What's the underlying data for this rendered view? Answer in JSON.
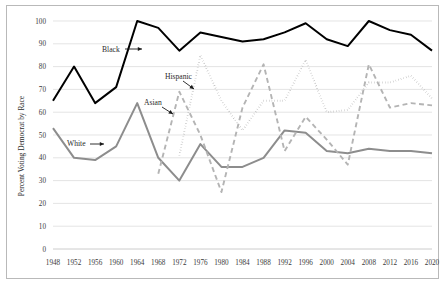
{
  "chart_data": {
    "type": "line",
    "title": "",
    "subtitle": "",
    "xlabel": "",
    "ylabel": "Percent Voting Democrat by Race",
    "xlim": [
      1948,
      2020
    ],
    "ylim": [
      0,
      100
    ],
    "ytick_step": 10,
    "yticks": [
      0,
      10,
      20,
      30,
      40,
      50,
      60,
      70,
      80,
      90,
      100
    ],
    "grid": true,
    "legend_position": "inline-annotations",
    "categories": [
      1948,
      1952,
      1956,
      1960,
      1964,
      1968,
      1972,
      1976,
      1980,
      1984,
      1988,
      1992,
      1996,
      2000,
      2004,
      2008,
      2012,
      2016,
      2020
    ],
    "xtick_labels": [
      "1948",
      "1952",
      "1956",
      "1960",
      "1964",
      "1968",
      "1972",
      "1976",
      "1980",
      "1984",
      "1988",
      "1992",
      "1996",
      "2000",
      "2004",
      "2008",
      "2012",
      "2016",
      "2020"
    ],
    "series": [
      {
        "name": "Black",
        "color": "#000000",
        "style": "solid",
        "width": 2.0,
        "x": [
          1948,
          1952,
          1956,
          1960,
          1964,
          1968,
          1972,
          1976,
          1980,
          1984,
          1988,
          1992,
          1996,
          2000,
          2004,
          2008,
          2012,
          2016,
          2020
        ],
        "values": [
          65,
          80,
          64,
          71,
          100,
          97,
          87,
          95,
          93,
          91,
          92,
          95,
          99,
          92,
          89,
          100,
          96,
          94,
          87
        ]
      },
      {
        "name": "White",
        "color": "#8d8d8d",
        "style": "solid",
        "width": 2.0,
        "x": [
          1948,
          1952,
          1956,
          1960,
          1964,
          1968,
          1972,
          1976,
          1980,
          1984,
          1988,
          1992,
          1996,
          2000,
          2004,
          2008,
          2012,
          2016,
          2020
        ],
        "values": [
          53,
          40,
          39,
          45,
          64,
          40,
          30,
          46,
          36,
          36,
          40,
          52,
          51,
          43,
          42,
          44,
          43,
          43,
          42
        ]
      },
      {
        "name": "Hispanic",
        "color": "#9a9a9a",
        "style": "dotted",
        "width": 1.9,
        "x": [
          1972,
          1976,
          1980,
          1984,
          1988,
          1992,
          1996,
          2000,
          2004,
          2008,
          2012,
          2016,
          2020
        ],
        "values": [
          41,
          85,
          65,
          52,
          65,
          65,
          83,
          60,
          61,
          73,
          73,
          76,
          66
        ]
      },
      {
        "name": "Asian",
        "color": "#b4b4b4",
        "style": "dashed",
        "width": 1.9,
        "x": [
          1968,
          1972,
          1976,
          1980,
          1984,
          1988,
          1992,
          1996,
          2000,
          2004,
          2008,
          2012,
          2016,
          2020
        ],
        "values": [
          33,
          69,
          50,
          25,
          62,
          81,
          43,
          58,
          48,
          37,
          81,
          62,
          64,
          63
        ]
      }
    ],
    "annotations": [
      {
        "text": "Black",
        "label_x": 95,
        "label_y": 46,
        "arrow_x1": 118,
        "arrow_y1": 43,
        "arrow_x2": 135,
        "arrow_y2": 43
      },
      {
        "text": "Hispanic",
        "label_x": 158,
        "label_y": 73,
        "arrow_x1": 176,
        "arrow_y1": 75,
        "arrow_x2": 187,
        "arrow_y2": 83
      },
      {
        "text": "Asian",
        "label_x": 137,
        "label_y": 99,
        "arrow_x1": 155,
        "arrow_y1": 101,
        "arrow_x2": 166,
        "arrow_y2": 108
      },
      {
        "text": "White",
        "label_x": 60,
        "label_y": 140,
        "arrow_x1": 83,
        "arrow_y1": 138,
        "arrow_x2": 97,
        "arrow_y2": 138
      }
    ]
  }
}
